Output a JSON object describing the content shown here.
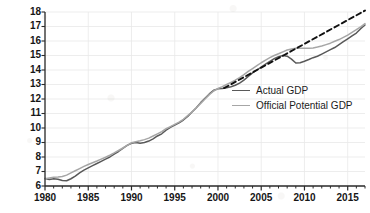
{
  "chart_data": {
    "type": "line",
    "title": "",
    "xlabel": "",
    "ylabel": "Trillions of Dollars",
    "xlim": [
      1980,
      2017
    ],
    "ylim": [
      6,
      18
    ],
    "grid": true,
    "legend_position": "center-right",
    "xticks": [
      1980,
      1985,
      1990,
      1995,
      2000,
      2005,
      2010,
      2015
    ],
    "xtick_labels": [
      "1980",
      "1985",
      "1990",
      "1995",
      "2000",
      "2005",
      "2010",
      "2015"
    ],
    "xtick_minor_step": 1,
    "yticks": [
      6,
      7,
      8,
      9,
      10,
      11,
      12,
      13,
      14,
      15,
      16,
      17,
      18
    ],
    "ytick_labels": [
      "6",
      "7",
      "8",
      "9",
      "10",
      "11",
      "12",
      "13",
      "14",
      "15",
      "16",
      "17",
      "18"
    ],
    "series": [
      {
        "name": "Actual GDP",
        "color": "#595959",
        "style": "solid",
        "width": 1.5,
        "x": [
          1980,
          1980.5,
          1981,
          1981.5,
          1982,
          1982.5,
          1983,
          1983.5,
          1984,
          1984.5,
          1985,
          1985.5,
          1986,
          1986.5,
          1987,
          1987.5,
          1988,
          1988.5,
          1989,
          1989.5,
          1990,
          1990.5,
          1991,
          1991.5,
          1992,
          1992.5,
          1993,
          1993.5,
          1994,
          1994.5,
          1995,
          1995.5,
          1996,
          1996.5,
          1997,
          1997.5,
          1998,
          1998.5,
          1999,
          1999.5,
          2000,
          2000.5,
          2001,
          2001.5,
          2002,
          2002.5,
          2003,
          2003.5,
          2004,
          2004.5,
          2005,
          2005.5,
          2006,
          2006.5,
          2007,
          2007.5,
          2008,
          2008.5,
          2009,
          2009.5,
          2010,
          2010.5,
          2011,
          2011.5,
          2012,
          2012.5,
          2013,
          2013.5,
          2014,
          2014.5,
          2015,
          2015.5,
          2016,
          2016.5,
          2017
        ],
        "y": [
          6.52,
          6.45,
          6.5,
          6.47,
          6.38,
          6.36,
          6.5,
          6.68,
          6.9,
          7.1,
          7.25,
          7.4,
          7.55,
          7.7,
          7.85,
          8.0,
          8.2,
          8.38,
          8.6,
          8.8,
          8.95,
          9.0,
          8.95,
          9.0,
          9.1,
          9.25,
          9.45,
          9.6,
          9.85,
          10.05,
          10.2,
          10.35,
          10.55,
          10.8,
          11.1,
          11.4,
          11.75,
          12.05,
          12.35,
          12.6,
          12.7,
          12.72,
          12.78,
          12.85,
          12.95,
          13.1,
          13.3,
          13.55,
          13.8,
          14.0,
          14.2,
          14.4,
          14.6,
          14.78,
          14.92,
          15.0,
          14.95,
          14.75,
          14.48,
          14.5,
          14.6,
          14.72,
          14.85,
          14.95,
          15.1,
          15.25,
          15.4,
          15.55,
          15.75,
          15.95,
          16.15,
          16.35,
          16.55,
          16.85,
          17.1
        ]
      },
      {
        "name": "Official Potential GDP",
        "color": "#a6a6a6",
        "style": "solid",
        "width": 1.5,
        "x": [
          1980,
          1980.5,
          1981,
          1981.5,
          1982,
          1982.5,
          1983,
          1983.5,
          1984,
          1984.5,
          1985,
          1985.5,
          1986,
          1986.5,
          1987,
          1987.5,
          1988,
          1988.5,
          1989,
          1989.5,
          1990,
          1990.5,
          1991,
          1991.5,
          1992,
          1992.5,
          1993,
          1993.5,
          1994,
          1994.5,
          1995,
          1995.5,
          1996,
          1996.5,
          1997,
          1997.5,
          1998,
          1998.5,
          1999,
          1999.5,
          2000,
          2000.5,
          2001,
          2001.5,
          2002,
          2002.5,
          2003,
          2003.5,
          2004,
          2004.5,
          2005,
          2005.5,
          2006,
          2006.5,
          2007,
          2007.5,
          2008,
          2008.5,
          2009,
          2009.5,
          2010,
          2010.5,
          2011,
          2011.5,
          2012,
          2012.5,
          2013,
          2013.5,
          2014,
          2014.5,
          2015,
          2015.5,
          2016,
          2016.5,
          2017
        ],
        "y": [
          6.5,
          6.55,
          6.6,
          6.62,
          6.65,
          6.75,
          6.9,
          7.05,
          7.2,
          7.35,
          7.48,
          7.6,
          7.72,
          7.85,
          7.98,
          8.12,
          8.28,
          8.45,
          8.62,
          8.8,
          8.98,
          9.05,
          9.12,
          9.2,
          9.3,
          9.45,
          9.6,
          9.75,
          9.95,
          10.1,
          10.25,
          10.4,
          10.6,
          10.85,
          11.1,
          11.4,
          11.7,
          12.0,
          12.3,
          12.55,
          12.72,
          12.85,
          13.0,
          13.15,
          13.3,
          13.48,
          13.68,
          13.9,
          14.1,
          14.3,
          14.5,
          14.68,
          14.85,
          15.0,
          15.12,
          15.25,
          15.38,
          15.45,
          15.5,
          15.5,
          15.5,
          15.5,
          15.52,
          15.58,
          15.65,
          15.75,
          15.85,
          15.98,
          16.1,
          16.25,
          16.4,
          16.6,
          16.78,
          16.98,
          17.2
        ]
      },
      {
        "name": "Pre-recession trend",
        "color": "#111111",
        "style": "dashed",
        "width": 1.9,
        "x": [
          2000.7,
          2017
        ],
        "y": [
          12.75,
          18.1
        ]
      }
    ],
    "legend_entries": [
      {
        "label": "Actual GDP",
        "color": "#595959"
      },
      {
        "label": "Official Potential GDP",
        "color": "#a6a6a6"
      }
    ],
    "annotations": []
  },
  "legend": {
    "actual_label": "Actual GDP",
    "potential_label": "Official Potential GDP"
  },
  "axes": {
    "y_title": "Trillions of Dollars"
  }
}
